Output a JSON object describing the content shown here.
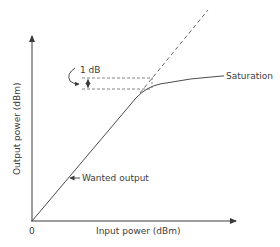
{
  "diagram": {
    "axes": {
      "x_label": "Input power (dBm)",
      "y_label": "Output power (dBm)",
      "origin_label": "0"
    },
    "annotations": {
      "compression_label": "1 dB",
      "saturation_label": "Saturation",
      "wanted_output_label": "Wanted output"
    },
    "colors": {
      "line": "#4a4a4a",
      "dashed": "#666666",
      "text": "#3d3d3d"
    },
    "elements": [
      {
        "id": "linear-response",
        "type": "solid-line",
        "desc": "Linear output rising from origin"
      },
      {
        "id": "saturation-curve",
        "type": "solid-curve",
        "desc": "Output flattens toward saturation"
      },
      {
        "id": "ideal-extension",
        "type": "dashed-line",
        "desc": "Extrapolated linear response"
      },
      {
        "id": "compression-markers",
        "type": "dashed-lines",
        "desc": "Horizontal dashed lines 1 dB apart"
      }
    ]
  }
}
